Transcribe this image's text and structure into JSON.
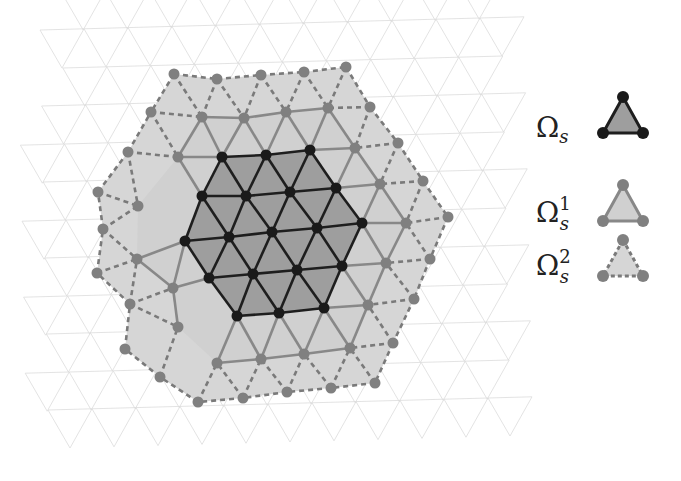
{
  "colors": {
    "background": "#ffffff",
    "bg_mesh": "#dcdcdc",
    "region2_fill": "#d6d6d6",
    "region1_fill": "#d0d0d0",
    "core_fill": "#9e9e9e",
    "core_node": "#1a1a1a",
    "core_edge": "#1e1e1e",
    "ring1_node": "#808080",
    "ring1_edge": "#888888",
    "ring2_edge": "#7a7a7a"
  },
  "core_nodes": [
    [
      222,
      157
    ],
    [
      266,
      155
    ],
    [
      310,
      150
    ],
    [
      202,
      196
    ],
    [
      246,
      196
    ],
    [
      290,
      192
    ],
    [
      336,
      188
    ],
    [
      185,
      241
    ],
    [
      229,
      237
    ],
    [
      272,
      232
    ],
    [
      317,
      228
    ],
    [
      362,
      223
    ],
    [
      209,
      278
    ],
    [
      253,
      274
    ],
    [
      297,
      270
    ],
    [
      342,
      266
    ],
    [
      237,
      316
    ],
    [
      279,
      313
    ],
    [
      324,
      308
    ]
  ],
  "core_rows": [
    [
      0,
      1,
      2
    ],
    [
      3,
      4,
      5,
      6
    ],
    [
      7,
      8,
      9,
      10,
      11
    ],
    [
      12,
      13,
      14,
      15
    ],
    [
      16,
      17,
      18
    ]
  ],
  "ring1_nodes": [
    [
      202,
      117
    ],
    [
      244,
      118
    ],
    [
      286,
      112
    ],
    [
      328,
      108
    ],
    [
      355,
      148
    ],
    [
      380,
      184
    ],
    [
      406,
      223
    ],
    [
      386,
      263
    ],
    [
      368,
      305
    ],
    [
      350,
      348
    ],
    [
      304,
      354
    ],
    [
      261,
      359
    ],
    [
      217,
      363
    ],
    [
      178,
      327
    ],
    [
      173,
      288
    ],
    [
      137,
      259
    ],
    [
      138,
      206
    ],
    [
      178,
      157
    ]
  ],
  "ring2_nodes": [
    [
      174,
      74
    ],
    [
      217,
      79
    ],
    [
      261,
      75
    ],
    [
      304,
      72
    ],
    [
      346,
      67
    ],
    [
      370,
      107
    ],
    [
      398,
      143
    ],
    [
      423,
      181
    ],
    [
      448,
      217
    ],
    [
      430,
      259
    ],
    [
      414,
      299
    ],
    [
      393,
      343
    ],
    [
      375,
      383
    ],
    [
      331,
      388
    ],
    [
      287,
      392
    ],
    [
      243,
      398
    ],
    [
      198,
      402
    ],
    [
      160,
      377
    ],
    [
      125,
      349
    ],
    [
      130,
      304
    ],
    [
      97,
      273
    ],
    [
      103,
      229
    ],
    [
      98,
      192
    ],
    [
      128,
      152
    ],
    [
      151,
      112
    ]
  ],
  "legend": {
    "items": [
      {
        "symbol": "Ω",
        "sub": "s",
        "sup": "",
        "style": "core",
        "y": 137
      },
      {
        "symbol": "Ω",
        "sub": "s",
        "sup": "1",
        "style": "ring1",
        "y": 222
      },
      {
        "symbol": "Ω",
        "sub": "s",
        "sup": "2",
        "style": "ring2",
        "y": 280
      }
    ]
  }
}
